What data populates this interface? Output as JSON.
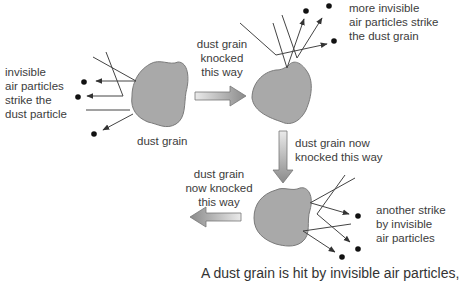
{
  "labels": {
    "left_particles": [
      "invisible",
      "air particles",
      "strike the",
      "dust particle"
    ],
    "grain1": "dust grain",
    "knocked1": [
      "dust grain",
      "knocked",
      "this way"
    ],
    "more_particles": [
      "more invisible",
      "air particles strike",
      "the dust grain"
    ],
    "knocked2": [
      "dust grain now",
      "knocked this way"
    ],
    "knocked3": [
      "dust grain",
      "now knocked",
      "this way"
    ],
    "another_strike": [
      "another strike",
      "by invisible",
      "air particles"
    ]
  },
  "caption": "A dust grain is hit by invisible air particles,",
  "colors": {
    "grain_fill": "#a9a9a9",
    "grain_stroke": "#7a7a7a",
    "line": "#444444",
    "dot": "#111111",
    "arrow_light": "#e6e6e6",
    "arrow_dark": "#8a8a8a"
  },
  "icons": {
    "arrow_right": "block-arrow-right",
    "arrow_down": "block-arrow-down",
    "arrow_left": "block-arrow-left"
  }
}
